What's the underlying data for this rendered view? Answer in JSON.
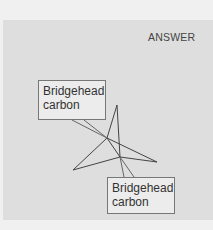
{
  "header": {
    "label": "ANSWER"
  },
  "diagram": {
    "labels": [
      {
        "line1": "Bridgehead",
        "line2": "carbon"
      },
      {
        "line1": "Bridgehead",
        "line2": "carbon"
      }
    ]
  },
  "colors": {
    "panel": "#dedede",
    "line": "#444444",
    "label_border": "#777777"
  }
}
